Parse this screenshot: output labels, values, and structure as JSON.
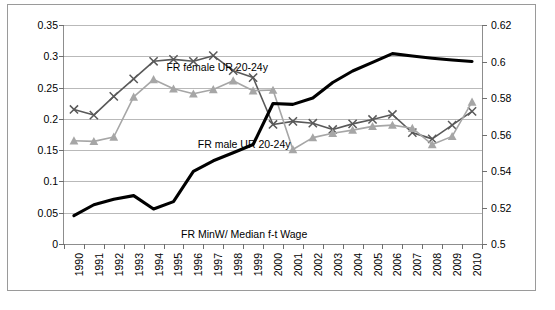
{
  "chart_data": {
    "type": "line",
    "title": "",
    "xlabel": "",
    "ylabel": "",
    "x": [
      1990,
      1991,
      1992,
      1993,
      1994,
      1995,
      1996,
      1997,
      1998,
      1999,
      2000,
      2001,
      2002,
      2003,
      2004,
      2005,
      2006,
      2007,
      2008,
      2009,
      2010
    ],
    "categories": [
      "1990",
      "1991",
      "1992",
      "1993",
      "1994",
      "1995",
      "1996",
      "1997",
      "1998",
      "1999",
      "2000",
      "2001",
      "2002",
      "2003",
      "2004",
      "2005",
      "2006",
      "2007",
      "2008",
      "2009",
      "2010"
    ],
    "grid": true,
    "legend": "annotations-inline",
    "left_axis": {
      "ylim": [
        0,
        0.35
      ],
      "tick_step": 0.05,
      "ticks": [
        "0",
        "0.05",
        "0.1",
        "0.15",
        "0.2",
        "0.25",
        "0.3",
        "0.35"
      ],
      "tick_values": [
        0,
        0.05,
        0.1,
        0.15,
        0.2,
        0.25,
        0.3,
        0.35
      ]
    },
    "right_axis": {
      "ylim": [
        0.5,
        0.62
      ],
      "tick_step": 0.02,
      "ticks": [
        "0.5",
        "0.52",
        "0.54",
        "0.56",
        "0.58",
        "0.6",
        "0.62"
      ],
      "tick_values": [
        0.5,
        0.52,
        0.54,
        0.56,
        0.58,
        0.6,
        0.62
      ]
    },
    "series": [
      {
        "name": "FR female UR 20-24y",
        "axis": "left",
        "color": "#595959",
        "marker": "x",
        "values": [
          0.215,
          0.206,
          0.236,
          0.264,
          0.292,
          0.295,
          0.292,
          0.301,
          0.277,
          0.266,
          0.191,
          0.196,
          0.193,
          0.183,
          0.192,
          0.199,
          0.207,
          0.178,
          0.168,
          0.19,
          0.212
        ]
      },
      {
        "name": "FR male UR 20-24y",
        "axis": "left",
        "color": "#a6a6a6",
        "marker": "triangle",
        "values": [
          0.165,
          0.164,
          0.171,
          0.235,
          0.263,
          0.248,
          0.24,
          0.247,
          0.261,
          0.245,
          0.246,
          0.151,
          0.17,
          0.177,
          0.182,
          0.188,
          0.19,
          0.185,
          0.159,
          0.172,
          0.227
        ]
      },
      {
        "name": "FR MinW/ Median f-t Wage",
        "axis": "right",
        "color": "#000000",
        "marker": "none",
        "values": [
          0.5155,
          0.5215,
          0.5245,
          0.5265,
          0.5192,
          0.5232,
          0.5398,
          0.5456,
          0.55,
          0.5545,
          0.577,
          0.5765,
          0.58,
          0.5885,
          0.5948,
          0.5995,
          0.6043,
          0.603,
          0.6018,
          0.6008,
          0.6
        ]
      }
    ],
    "annotations": [
      {
        "text": "FR female UR 20-24y",
        "x_pct": 24.5,
        "y_px": 37
      },
      {
        "text": "FR male UR 20-24y",
        "x_pct": 32.0,
        "y_px": 114
      },
      {
        "text": "FR MinW/ Median f-t Wage",
        "x_pct": 28.0,
        "y_px": 204
      }
    ]
  },
  "caption": {
    "text": ""
  }
}
